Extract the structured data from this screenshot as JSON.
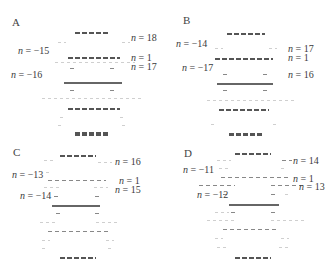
{
  "figure": {
    "panels": [
      {
        "id": "A",
        "letter": "A",
        "labels": {
          "left": [
            "n = −15",
            "n = −16"
          ],
          "right": [
            "n = 18",
            "n = 1",
            "n = 17"
          ]
        }
      },
      {
        "id": "B",
        "letter": "B",
        "labels": {
          "left": [
            "n = −14",
            "n = −17"
          ],
          "right": [
            "n = 17",
            "n = 1",
            "n = 16"
          ]
        }
      },
      {
        "id": "C",
        "letter": "C",
        "labels": {
          "left": [
            "n = −13",
            "n = −14"
          ],
          "right": [
            "n = 16",
            "n = 1",
            "n = 15"
          ]
        }
      },
      {
        "id": "D",
        "letter": "D",
        "labels": {
          "left": [
            "n = −11",
            "n = −12"
          ],
          "right": [
            "n = 14",
            "n = 1",
            "n = 13"
          ]
        }
      }
    ]
  }
}
